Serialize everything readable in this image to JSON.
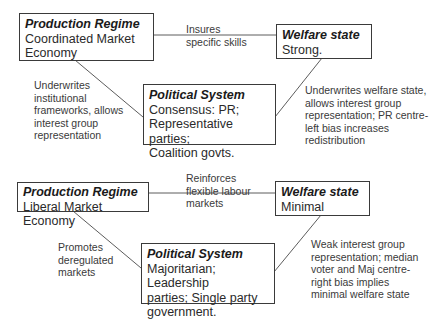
{
  "diagrams": [
    {
      "name": "coordinated-market-economy",
      "production_regime": {
        "title": "Production Regime",
        "body": "Coordinated Market\nEconomy"
      },
      "welfare_state": {
        "title": "Welfare state",
        "body": "Strong."
      },
      "political_system": {
        "title": "Political System",
        "body": "Consensus: PR;\nRepresentative parties;\nCoalition govts."
      },
      "links": {
        "production_to_welfare": "Insures\nspecific skills",
        "production_to_political": "Underwrites\ninstitutional\nframeworks, allows\ninterest group\nrepresentation",
        "political_to_welfare": "Underwrites welfare state,\nallows interest group\nrepresentation; PR centre-\nleft bias increases\nredistribution"
      }
    },
    {
      "name": "liberal-market-economy",
      "production_regime": {
        "title": "Production Regime",
        "body": "Liberal Market Economy"
      },
      "welfare_state": {
        "title": "Welfare state",
        "body": "Minimal"
      },
      "political_system": {
        "title": "Political System",
        "body": "Majoritarian; Leadership\nparties; Single party\ngovernment."
      },
      "links": {
        "production_to_welfare": "Reinforces\nflexible labour\nmarkets",
        "production_to_political": "Promotes\nderegulated\nmarkets",
        "political_to_welfare": "Weak interest group\nrepresentation; median\nvoter and Maj centre-\nright bias implies\nminimal welfare state"
      }
    }
  ]
}
